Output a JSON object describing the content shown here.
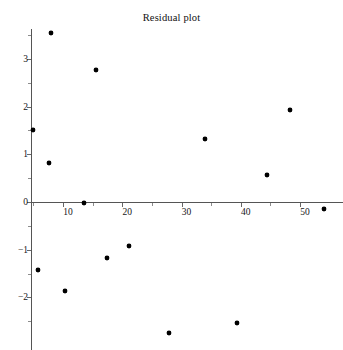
{
  "chart_data": {
    "type": "scatter",
    "title": "Residual plot",
    "xlabel": "",
    "ylabel": "",
    "grid": false,
    "legend": null,
    "xlim": [
      4.6,
      57.2
    ],
    "ylim": [
      -2.95,
      3.75
    ],
    "x_ticks": [
      10,
      20,
      30,
      40,
      50
    ],
    "x_tick_labels": [
      "10",
      "20",
      "30",
      "40",
      "50"
    ],
    "x_minor_ticks": [
      5,
      15,
      25,
      35,
      45
    ],
    "y_ticks": [
      -2,
      -1,
      0,
      1,
      2,
      3
    ],
    "y_tick_labels": [
      "-2",
      "-1",
      "0",
      "1",
      "2",
      "3"
    ],
    "y_minor_ticks": [
      -2.5,
      -1.5,
      -0.5,
      0.5,
      1.5,
      2.5,
      3.5
    ],
    "x": [
      4.9,
      5.7,
      7.6,
      7.9,
      10.3,
      13.5,
      15.5,
      17.4,
      21.2,
      27.8,
      33.9,
      39.4,
      44.4,
      48.3,
      54.0
    ],
    "y": [
      1.52,
      -1.43,
      0.81,
      3.54,
      -1.86,
      -0.01,
      2.76,
      -1.17,
      -0.93,
      -2.75,
      1.33,
      -2.54,
      0.56,
      1.93,
      -0.15
    ],
    "points": [
      {
        "x": 4.9,
        "y": 1.52
      },
      {
        "x": 5.7,
        "y": -1.43
      },
      {
        "x": 7.6,
        "y": 0.81
      },
      {
        "x": 7.9,
        "y": 3.54
      },
      {
        "x": 10.3,
        "y": -1.86
      },
      {
        "x": 13.5,
        "y": -0.01
      },
      {
        "x": 15.5,
        "y": 2.76
      },
      {
        "x": 17.4,
        "y": -1.17
      },
      {
        "x": 21.2,
        "y": -0.93
      },
      {
        "x": 27.8,
        "y": -2.75
      },
      {
        "x": 33.9,
        "y": 1.33
      },
      {
        "x": 39.4,
        "y": -2.54
      },
      {
        "x": 44.4,
        "y": 0.56
      },
      {
        "x": 48.3,
        "y": 1.93
      },
      {
        "x": 54.0,
        "y": -0.15
      }
    ],
    "marker": {
      "shape": "circle",
      "color": "#000000",
      "size": 4
    },
    "axis_color": "#555555"
  }
}
